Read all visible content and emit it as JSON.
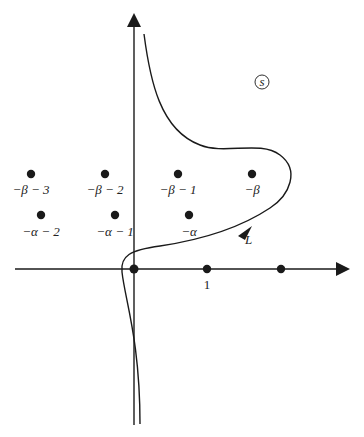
{
  "diagram": {
    "type": "complex-plane-contour",
    "region_label": "s",
    "contour_label": "L",
    "axes": {
      "horizontal": {
        "tick_label": "1"
      },
      "vertical": {}
    },
    "points_beta": [
      {
        "label": "−β − 3"
      },
      {
        "label": "−β − 2"
      },
      {
        "label": "−β − 1"
      },
      {
        "label": "−β"
      }
    ],
    "points_alpha": [
      {
        "label": "−α − 2"
      },
      {
        "label": "−α − 1"
      },
      {
        "label": "−α"
      }
    ],
    "axis_points": [
      {
        "label": ""
      },
      {
        "label": "1"
      },
      {
        "label": ""
      }
    ],
    "colors": {
      "ink": "#1a1a1a",
      "background": "#ffffff"
    }
  }
}
